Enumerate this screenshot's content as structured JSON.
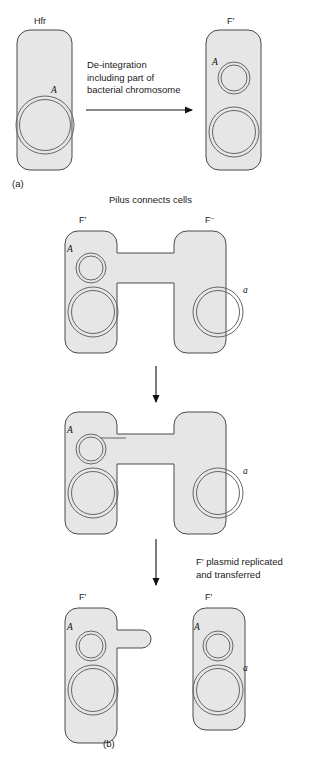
{
  "figure": {
    "panels": [
      {
        "id": "panel-a",
        "label": "(a)"
      },
      {
        "id": "panel-b",
        "label": "(b)"
      }
    ]
  },
  "panel_a": {
    "left_cell": {
      "type_label": "Hfr",
      "gene_label": "A",
      "description": "Hfr cell with integrated F factor in bacterial chromosome"
    },
    "right_cell": {
      "type_label": "F′",
      "gene_label": "A",
      "description": "F-prime cell with excised plasmid carrying gene A"
    },
    "arrow_caption": "De-integration\nincluding part of\nbacterial chromosome"
  },
  "panel_b": {
    "header_caption": "Pilus connects cells",
    "stage1": {
      "left_cell": {
        "type_label": "F′",
        "gene_label": "A"
      },
      "right_cell": {
        "type_label": "F⁻",
        "gene_label": "a"
      }
    },
    "stage2": {
      "left_cell": {
        "type_label": "",
        "gene_label": "A"
      },
      "right_cell": {
        "type_label": "",
        "gene_label": "a"
      }
    },
    "stage3": {
      "left_cell": {
        "type_label": "F′",
        "gene_label": "A"
      },
      "right_cell": {
        "type_label": "F′",
        "gene_label_top": "A",
        "gene_label_bottom": "a"
      }
    },
    "arrow_caption_1": "",
    "arrow_caption_2": "F′ plasmid replicated\nand transferred"
  },
  "style": {
    "cell_fill": "#e6e6e6",
    "cell_stroke": "#4a4a4a",
    "ring_stroke": "#666666",
    "arrow_color": "#111111",
    "background": "#ffffff"
  }
}
